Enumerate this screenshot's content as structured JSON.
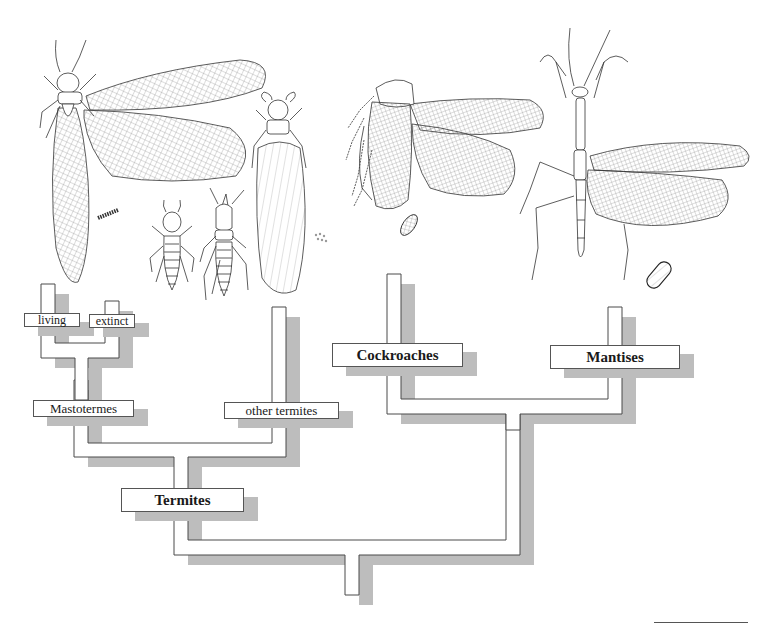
{
  "tree": {
    "labels": {
      "living": "living",
      "extinct": "extinct",
      "mastotermes": "Mastotermes",
      "other_termites": "other termites",
      "termites": "Termites",
      "cockroaches": "Cockroaches",
      "mantises": "Mantises"
    },
    "topology": "((((living, extinct) Mastotermes, other termites) Termites), (Cockroaches, Mantises))"
  },
  "illustrations": [
    {
      "name": "mastotermes-winged-adult",
      "group": "Mastotermes"
    },
    {
      "name": "termite-egg-pod",
      "group": "Mastotermes"
    },
    {
      "name": "termite-worker",
      "group": "other termites"
    },
    {
      "name": "termite-soldier",
      "group": "other termites"
    },
    {
      "name": "termite-alate",
      "group": "other termites"
    },
    {
      "name": "termite-eggs",
      "group": "other termites"
    },
    {
      "name": "cockroach-winged-adult",
      "group": "Cockroaches"
    },
    {
      "name": "cockroach-ootheca",
      "group": "Cockroaches"
    },
    {
      "name": "mantis-winged-adult",
      "group": "Mantises"
    },
    {
      "name": "mantis-ootheca",
      "group": "Mantises"
    }
  ],
  "colors": {
    "pipe_fill": "#ffffff",
    "pipe_outline": "#4a4a4a",
    "shadow": "#bdbdbd",
    "ink": "#1a1a1a"
  }
}
